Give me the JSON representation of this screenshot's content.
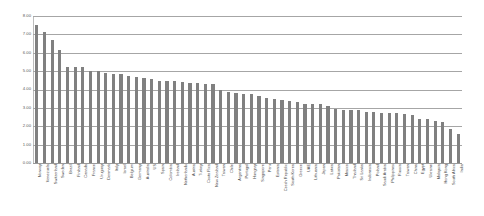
{
  "chart_data": {
    "type": "bar",
    "title": "",
    "subtitle": "",
    "xlabel": "",
    "ylabel": "",
    "ylim": [
      0,
      8
    ],
    "ytick_labels": [
      "8.00",
      "7.00",
      "6.00",
      "5.00",
      "4.00",
      "3.00",
      "2.00",
      "1.00",
      "0.00"
    ],
    "ytick_values": [
      8,
      7,
      6,
      5,
      4,
      3,
      2,
      1,
      0
    ],
    "grid": true,
    "legend": null,
    "series_color": "#808080",
    "categories": [
      "Norway",
      "Venezuela",
      "Switzerland",
      "Sweden",
      "Brazil",
      "Finland",
      "Canada",
      "France",
      "Uruguay",
      "Denmark",
      "Italy",
      "Israel",
      "Belgium",
      "Germany",
      "Australia",
      "US",
      "Spain",
      "Colombia",
      "Ireland",
      "Netherlands",
      "Austria",
      "Turkey",
      "Costa Rica",
      "New Zealand",
      "Taiwan",
      "Chile",
      "Argentina",
      "Portugal",
      "Hungary",
      "Singapore",
      "Peru",
      "Estonia",
      "Czech Republic",
      "South Korea",
      "Greece",
      "UAE",
      "Lithuania",
      "Japan",
      "Latvia",
      "Pakistan",
      "Mexico",
      "Thailand",
      "Sri Lanka",
      "Indonesia",
      "Poland",
      "Saudi Arabia",
      "Philippines",
      "Russia",
      "Taiwan",
      "China",
      "Egypt",
      "Ukraine",
      "Malaysia",
      "Hong Kong",
      "South Africa",
      "India"
    ],
    "values": [
      7.5,
      7.12,
      6.7,
      6.15,
      5.25,
      5.25,
      5.22,
      5.0,
      5.0,
      4.9,
      4.83,
      4.82,
      4.76,
      4.7,
      4.65,
      4.56,
      4.46,
      4.48,
      4.45,
      4.43,
      4.36,
      4.33,
      4.3,
      4.29,
      3.98,
      3.88,
      3.79,
      3.76,
      3.73,
      3.63,
      3.56,
      3.5,
      3.43,
      3.39,
      3.32,
      3.23,
      3.21,
      3.2,
      3.08,
      2.96,
      2.88,
      2.87,
      2.86,
      2.8,
      2.75,
      2.72,
      2.7,
      2.7,
      2.69,
      2.6,
      2.42,
      2.38,
      2.31,
      2.22,
      1.85,
      1.57
    ]
  }
}
